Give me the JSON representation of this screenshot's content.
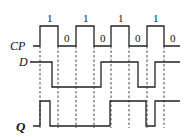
{
  "diagram": {
    "type": "timing-diagram",
    "signals": [
      {
        "name": "CP",
        "label": "CP",
        "levels": [
          "0",
          "1",
          "0",
          "1",
          "0",
          "1",
          "0",
          "1",
          "0"
        ]
      },
      {
        "name": "D",
        "label": "D",
        "levels": [
          "1",
          "0",
          "1",
          "0",
          "1"
        ]
      },
      {
        "name": "Q",
        "label": "Q",
        "levels": [
          "0",
          "1",
          "0",
          "1",
          "0",
          "1"
        ]
      }
    ],
    "clock_labels": {
      "high": [
        "1",
        "1",
        "1",
        "1"
      ],
      "low": [
        "0",
        "0",
        "0",
        "0"
      ]
    }
  }
}
